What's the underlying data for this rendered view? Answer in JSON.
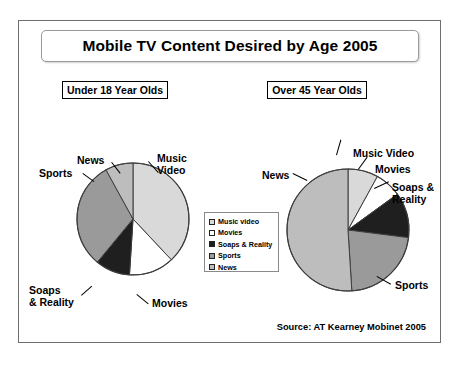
{
  "slide": {
    "title": "Mobile TV Content Desired by Age 2005",
    "source": "Source: AT Kearney Mobinet 2005"
  },
  "legend": {
    "items": [
      {
        "label": "Music video",
        "color": "#d9d9d9",
        "swatch": "light-gray-swatch"
      },
      {
        "label": "Movies",
        "color": "#ffffff",
        "swatch": "white-swatch"
      },
      {
        "label": "Soaps & Reality",
        "color": "#1f1f1f",
        "swatch": "black-swatch"
      },
      {
        "label": "Sports",
        "color": "#9a9a9a",
        "swatch": "medium-gray-swatch"
      },
      {
        "label": "News",
        "color": "#bdbdbd",
        "swatch": "gray-swatch"
      }
    ]
  },
  "chart_data": [
    {
      "type": "pie",
      "title": "Under 18 Year Olds",
      "categories": [
        "Music Video",
        "Movies",
        "Soaps & Reality",
        "Sports",
        "News"
      ],
      "values": [
        38,
        13,
        10,
        31,
        8
      ],
      "colors": [
        "#d9d9d9",
        "#ffffff",
        "#1f1f1f",
        "#9a9a9a",
        "#bdbdbd"
      ],
      "start_angle_deg": 0,
      "direction": "clockwise",
      "labels": {
        "music_video": "Music\nVideo",
        "music_video_line1": "Music",
        "music_video_line2": "Video",
        "movies": "Movies",
        "soaps_line1": "Soaps",
        "soaps_line2": "& Reality",
        "sports": "Sports",
        "news": "News"
      },
      "legend_position": "center-between-pies",
      "grid": false
    },
    {
      "type": "pie",
      "title": "Over 45 Year Olds",
      "categories": [
        "Music Video",
        "Movies",
        "Soaps & Reality",
        "Sports",
        "News"
      ],
      "values": [
        8,
        7,
        12,
        22,
        51
      ],
      "colors": [
        "#d9d9d9",
        "#ffffff",
        "#1f1f1f",
        "#9a9a9a",
        "#bdbdbd"
      ],
      "start_angle_deg": 0,
      "direction": "clockwise",
      "labels": {
        "music_video": "Music Video",
        "movies": "Movies",
        "soaps_line1": "Soaps &",
        "soaps_line2": "Reality",
        "sports": "Sports",
        "news": "News"
      },
      "legend_position": "center-between-pies",
      "grid": false
    }
  ]
}
